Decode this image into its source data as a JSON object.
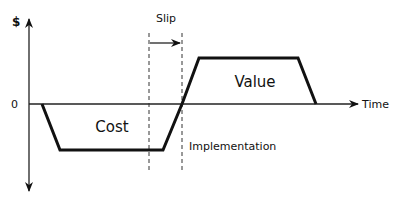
{
  "diagram": {
    "type": "cost-value-timeline",
    "y_axis_label": "$",
    "zero_label": "0",
    "x_axis_label": "Time",
    "slip_label": "Slip",
    "cost_label": "Cost",
    "value_label": "Value",
    "implementation_label": "Implementation",
    "phases": [
      {
        "name": "Cost",
        "sign": "negative",
        "shape": "trapezoid",
        "description": "ramp down, flat plateau, ramp up to zero"
      },
      {
        "name": "Value",
        "sign": "positive",
        "shape": "trapezoid",
        "description": "ramp up from implementation, flat plateau, ramp down to zero"
      }
    ],
    "annotations": [
      {
        "name": "Slip",
        "type": "interval-arrow",
        "between": "two dashed vertical lines"
      },
      {
        "name": "Implementation",
        "type": "marker",
        "position": "second dashed line where cost curve crosses zero"
      }
    ],
    "colors": {
      "line": "#111111",
      "background": "#ffffff"
    }
  }
}
